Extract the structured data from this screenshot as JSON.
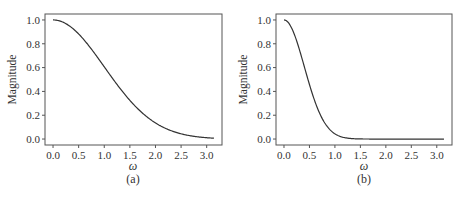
{
  "chart_data": [
    {
      "type": "line",
      "panel_label": "(a)",
      "xlabel": "ω",
      "ylabel": "Magnitude",
      "xlim": [
        0,
        3.1416
      ],
      "ylim": [
        0,
        1.0
      ],
      "xticks": [
        "0.0",
        "0.5",
        "1.0",
        "1.5",
        "2.0",
        "2.5",
        "3.0"
      ],
      "yticks": [
        "0.0",
        "0.2",
        "0.4",
        "0.6",
        "0.8",
        "1.0"
      ],
      "grid": false,
      "series": [
        {
          "name": "magnitude",
          "x": [
            0.0,
            0.25,
            0.5,
            0.75,
            1.0,
            1.25,
            1.5,
            1.75,
            2.0,
            2.25,
            2.5,
            2.75,
            3.0,
            3.14
          ],
          "values": [
            1.0,
            0.97,
            0.88,
            0.75,
            0.61,
            0.46,
            0.32,
            0.22,
            0.14,
            0.08,
            0.04,
            0.02,
            0.01,
            0.01
          ]
        }
      ],
      "sigma": 1.0
    },
    {
      "type": "line",
      "panel_label": "(b)",
      "xlabel": "ω",
      "ylabel": "Magnitude",
      "xlim": [
        0,
        3.1416
      ],
      "ylim": [
        0,
        1.0
      ],
      "xticks": [
        "0.0",
        "0.5",
        "1.0",
        "1.5",
        "2.0",
        "2.5",
        "3.0"
      ],
      "yticks": [
        "0.0",
        "0.2",
        "0.4",
        "0.6",
        "0.8",
        "1.0"
      ],
      "grid": false,
      "series": [
        {
          "name": "magnitude",
          "x": [
            0.0,
            0.1,
            0.2,
            0.3,
            0.4,
            0.5,
            0.6,
            0.7,
            0.8,
            0.9,
            1.0,
            1.2,
            1.5,
            2.0,
            2.5,
            3.14
          ],
          "values": [
            1.0,
            0.97,
            0.88,
            0.75,
            0.61,
            0.46,
            0.32,
            0.22,
            0.14,
            0.08,
            0.04,
            0.01,
            0.0,
            0.0,
            0.0,
            0.0
          ]
        }
      ],
      "sigma": 0.4
    }
  ],
  "panels": [
    {
      "caption": "(a)",
      "xlabel": "ω",
      "ylabel": "Magnitude"
    },
    {
      "caption": "(b)",
      "xlabel": "ω",
      "ylabel": "Magnitude"
    }
  ]
}
